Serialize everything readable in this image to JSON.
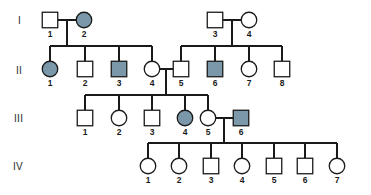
{
  "diagram": {
    "type": "pedigree-chart",
    "background_color": "#ffffff",
    "line_color": "#1a1a1a",
    "unaffected_fill": "#ffffff",
    "affected_fill": "#7b98ab",
    "generation_labels": [
      {
        "id": "gen-I",
        "text": "I",
        "x": 18,
        "y": 24
      },
      {
        "id": "gen-II",
        "text": "II",
        "x": 16,
        "y": 74
      },
      {
        "id": "gen-III",
        "text": "III",
        "x": 14,
        "y": 122
      },
      {
        "id": "gen-IV",
        "text": "IV",
        "x": 13,
        "y": 170
      }
    ],
    "individuals": [
      {
        "key": "I-1",
        "gen": "I",
        "num": "1",
        "sex": "male",
        "affected": false,
        "cx": 50,
        "cy": 20,
        "label_x": 50,
        "label_y": 37
      },
      {
        "key": "I-2",
        "gen": "I",
        "num": "2",
        "sex": "female",
        "affected": true,
        "cx": 84,
        "cy": 20,
        "label_x": 84,
        "label_y": 37
      },
      {
        "key": "I-3",
        "gen": "I",
        "num": "3",
        "sex": "male",
        "affected": false,
        "cx": 215,
        "cy": 20,
        "label_x": 215,
        "label_y": 37
      },
      {
        "key": "I-4",
        "gen": "I",
        "num": "4",
        "sex": "female",
        "affected": false,
        "cx": 249,
        "cy": 20,
        "label_x": 249,
        "label_y": 37
      },
      {
        "key": "II-1",
        "gen": "II",
        "num": "1",
        "sex": "female",
        "affected": true,
        "cx": 50,
        "cy": 69,
        "label_x": 50,
        "label_y": 86
      },
      {
        "key": "II-2",
        "gen": "II",
        "num": "2",
        "sex": "male",
        "affected": false,
        "cx": 85,
        "cy": 69,
        "label_x": 85,
        "label_y": 86
      },
      {
        "key": "II-3",
        "gen": "II",
        "num": "3",
        "sex": "male",
        "affected": true,
        "cx": 119,
        "cy": 69,
        "label_x": 119,
        "label_y": 86
      },
      {
        "key": "II-4",
        "gen": "II",
        "num": "4",
        "sex": "female",
        "affected": false,
        "cx": 152,
        "cy": 69,
        "label_x": 152,
        "label_y": 86
      },
      {
        "key": "II-5",
        "gen": "II",
        "num": "5",
        "sex": "male",
        "affected": false,
        "cx": 181,
        "cy": 69,
        "label_x": 181,
        "label_y": 86
      },
      {
        "key": "II-6",
        "gen": "II",
        "num": "6",
        "sex": "male",
        "affected": true,
        "cx": 215,
        "cy": 69,
        "label_x": 215,
        "label_y": 86
      },
      {
        "key": "II-7",
        "gen": "II",
        "num": "7",
        "sex": "female",
        "affected": false,
        "cx": 249,
        "cy": 69,
        "label_x": 249,
        "label_y": 86
      },
      {
        "key": "II-8",
        "gen": "II",
        "num": "8",
        "sex": "male",
        "affected": false,
        "cx": 282,
        "cy": 69,
        "label_x": 282,
        "label_y": 86
      },
      {
        "key": "III-1",
        "gen": "III",
        "num": "1",
        "sex": "male",
        "affected": false,
        "cx": 85,
        "cy": 118,
        "label_x": 85,
        "label_y": 135
      },
      {
        "key": "III-2",
        "gen": "III",
        "num": "2",
        "sex": "female",
        "affected": false,
        "cx": 119,
        "cy": 118,
        "label_x": 119,
        "label_y": 135
      },
      {
        "key": "III-3",
        "gen": "III",
        "num": "3",
        "sex": "male",
        "affected": false,
        "cx": 152,
        "cy": 118,
        "label_x": 152,
        "label_y": 135
      },
      {
        "key": "III-4",
        "gen": "III",
        "num": "4",
        "sex": "female",
        "affected": true,
        "cx": 185,
        "cy": 118,
        "label_x": 185,
        "label_y": 135
      },
      {
        "key": "III-5",
        "gen": "III",
        "num": "5",
        "sex": "female",
        "affected": false,
        "cx": 208,
        "cy": 118,
        "label_x": 208,
        "label_y": 135
      },
      {
        "key": "III-6",
        "gen": "III",
        "num": "6",
        "sex": "male",
        "affected": true,
        "cx": 241,
        "cy": 118,
        "label_x": 241,
        "label_y": 135
      },
      {
        "key": "IV-1",
        "gen": "IV",
        "num": "1",
        "sex": "female",
        "affected": false,
        "cx": 148,
        "cy": 166,
        "label_x": 148,
        "label_y": 183
      },
      {
        "key": "IV-2",
        "gen": "IV",
        "num": "2",
        "sex": "female",
        "affected": false,
        "cx": 179,
        "cy": 166,
        "label_x": 179,
        "label_y": 183
      },
      {
        "key": "IV-3",
        "gen": "IV",
        "num": "3",
        "sex": "male",
        "affected": false,
        "cx": 211,
        "cy": 166,
        "label_x": 211,
        "label_y": 183
      },
      {
        "key": "IV-4",
        "gen": "IV",
        "num": "4",
        "sex": "female",
        "affected": false,
        "cx": 242,
        "cy": 166,
        "label_x": 242,
        "label_y": 183
      },
      {
        "key": "IV-5",
        "gen": "IV",
        "num": "5",
        "sex": "male",
        "affected": false,
        "cx": 274,
        "cy": 166,
        "label_x": 274,
        "label_y": 183
      },
      {
        "key": "IV-6",
        "gen": "IV",
        "num": "6",
        "sex": "male",
        "affected": false,
        "cx": 305,
        "cy": 166,
        "label_x": 305,
        "label_y": 183
      },
      {
        "key": "IV-7",
        "gen": "IV",
        "num": "7",
        "sex": "female",
        "affected": false,
        "cx": 337,
        "cy": 166,
        "label_x": 337,
        "label_y": 183
      }
    ],
    "connectors": [
      {
        "name": "mating-line-I1-I2",
        "d": "M 58 20 L 76 20"
      },
      {
        "name": "mating-line-I3-I4",
        "d": "M 223 20 L 241 20"
      },
      {
        "name": "mating-line-II4-II5",
        "d": "M 160 69 L 173 69"
      },
      {
        "name": "mating-line-III5-III6",
        "d": "M 216 118 L 233 118"
      },
      {
        "name": "descent-line-family-A",
        "d": "M 67 20 L 67 46"
      },
      {
        "name": "sibship-line-family-A",
        "d": "M 50 46 L 152 46"
      },
      {
        "name": "sibship-drop-II1",
        "d": "M 50 46 L 50 61"
      },
      {
        "name": "sibship-drop-II2",
        "d": "M 85 46 L 85 61"
      },
      {
        "name": "sibship-drop-II3",
        "d": "M 119 46 L 119 61"
      },
      {
        "name": "sibship-drop-II4",
        "d": "M 152 46 L 152 61"
      },
      {
        "name": "descent-line-family-B",
        "d": "M 232 20 L 232 46"
      },
      {
        "name": "sibship-line-family-B",
        "d": "M 181 46 L 282 46"
      },
      {
        "name": "sibship-drop-II5",
        "d": "M 181 46 L 181 61"
      },
      {
        "name": "sibship-drop-II6",
        "d": "M 215 46 L 215 61"
      },
      {
        "name": "sibship-drop-II7",
        "d": "M 249 46 L 249 61"
      },
      {
        "name": "sibship-drop-II8",
        "d": "M 282 46 L 282 61"
      },
      {
        "name": "descent-line-family-C",
        "d": "M 166 69 L 166 95"
      },
      {
        "name": "sibship-line-family-C",
        "d": "M 85 95 L 208 95"
      },
      {
        "name": "sibship-drop-III1",
        "d": "M 85 95 L 85 110"
      },
      {
        "name": "sibship-drop-III2",
        "d": "M 119 95 L 119 110"
      },
      {
        "name": "sibship-drop-III3",
        "d": "M 152 95 L 152 110"
      },
      {
        "name": "sibship-drop-III4",
        "d": "M 185 95 L 185 110"
      },
      {
        "name": "sibship-drop-III5",
        "d": "M 208 95 L 208 110"
      },
      {
        "name": "descent-line-family-D",
        "d": "M 224 118 L 224 143"
      },
      {
        "name": "sibship-line-family-D",
        "d": "M 148 143 L 337 143"
      },
      {
        "name": "sibship-drop-IV1",
        "d": "M 148 143 L 148 158"
      },
      {
        "name": "sibship-drop-IV2",
        "d": "M 179 143 L 179 158"
      },
      {
        "name": "sibship-drop-IV3",
        "d": "M 211 143 L 211 158"
      },
      {
        "name": "sibship-drop-IV4",
        "d": "M 242 143 L 242 158"
      },
      {
        "name": "sibship-drop-IV5",
        "d": "M 274 143 L 274 158"
      },
      {
        "name": "sibship-drop-IV6",
        "d": "M 305 143 L 305 158"
      },
      {
        "name": "sibship-drop-IV7",
        "d": "M 337 143 L 337 158"
      }
    ]
  },
  "chart_data": {
    "type": "table",
    "title": "",
    "legend": [
      {
        "symbol": "square",
        "meaning": "male"
      },
      {
        "symbol": "circle",
        "meaning": "female"
      },
      {
        "symbol": "filled",
        "meaning": "affected"
      },
      {
        "symbol": "open",
        "meaning": "unaffected"
      }
    ],
    "generations": [
      "I",
      "II",
      "III",
      "IV"
    ],
    "counts_per_generation": [
      4,
      8,
      6,
      7
    ],
    "affected_individuals": [
      "I-2",
      "II-1",
      "II-3",
      "II-6",
      "III-4",
      "III-6"
    ],
    "matings": [
      {
        "parents": [
          "I-1",
          "I-2"
        ],
        "children": [
          "II-1",
          "II-2",
          "II-3",
          "II-4"
        ]
      },
      {
        "parents": [
          "I-3",
          "I-4"
        ],
        "children": [
          "II-5",
          "II-6",
          "II-7",
          "II-8"
        ]
      },
      {
        "parents": [
          "II-4",
          "II-5"
        ],
        "children": [
          "III-1",
          "III-2",
          "III-3",
          "III-4",
          "III-5"
        ]
      },
      {
        "parents": [
          "III-5",
          "III-6"
        ],
        "children": [
          "IV-1",
          "IV-2",
          "IV-3",
          "IV-4",
          "IV-5",
          "IV-6",
          "IV-7"
        ]
      }
    ]
  }
}
